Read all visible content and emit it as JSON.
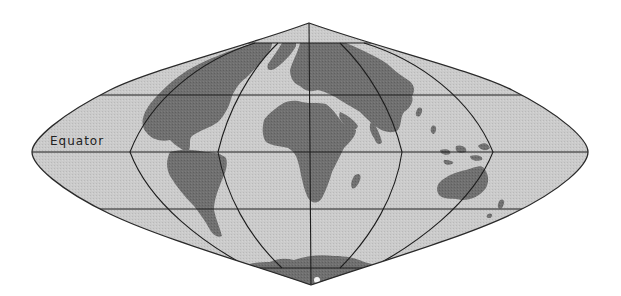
{
  "map": {
    "projection": "sinusoidal",
    "labels": {
      "equator": "Equator"
    },
    "colors": {
      "background": "#ffffff",
      "ocean": "#c9c9c9",
      "land": "#6f6f6f",
      "grid": "#1e1e1e",
      "outline": "#2a2a2a",
      "label": "#222222"
    },
    "parallels_y": [
      43,
      95,
      152,
      209,
      268
    ],
    "meridians_at_equator_x": [
      130,
      218,
      309,
      402,
      493
    ],
    "outline": {
      "top": [
        309,
        23
      ],
      "bottom": [
        311,
        285
      ],
      "left": [
        32,
        152
      ],
      "right": [
        588,
        152
      ]
    }
  }
}
